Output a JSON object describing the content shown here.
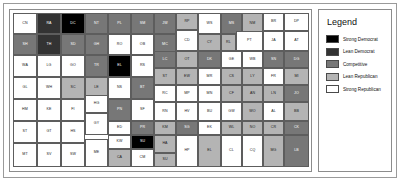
{
  "figure": {
    "kind": "choropleth-map"
  },
  "legend": {
    "title": "Legend",
    "items": [
      {
        "label": "Strong Democrat",
        "color": "#000000",
        "class": "c0"
      },
      {
        "label": "Lean Democrat",
        "color": "#333333",
        "class": "c1"
      },
      {
        "label": "Competitive",
        "color": "#777777",
        "class": "c2"
      },
      {
        "label": "Lean Republican",
        "color": "#b4b4b4",
        "class": "c3"
      },
      {
        "label": "Strong Republican",
        "color": "#ffffff",
        "class": "c4"
      }
    ]
  },
  "chart_data": {
    "type": "heatmap",
    "title": "",
    "xlabel": "",
    "ylabel": "",
    "grid": false,
    "legend_position": "right",
    "value_scale": [
      "Strong Democrat",
      "Lean Democrat",
      "Competitive",
      "Lean Republican",
      "Strong Republican"
    ],
    "counties": [
      {
        "code": "CN",
        "x": 3,
        "y": 3,
        "w": 24,
        "h": 21,
        "level": 4
      },
      {
        "code": "RA",
        "x": 27,
        "y": 3,
        "w": 24,
        "h": 21,
        "level": 1
      },
      {
        "code": "DC",
        "x": 51,
        "y": 3,
        "w": 24,
        "h": 21,
        "level": 0
      },
      {
        "code": "NT",
        "x": 75,
        "y": 3,
        "w": 23,
        "h": 21,
        "level": 2
      },
      {
        "code": "PL",
        "x": 98,
        "y": 3,
        "w": 23,
        "h": 21,
        "level": 2
      },
      {
        "code": "SM",
        "x": 121,
        "y": 3,
        "w": 23,
        "h": 21,
        "level": 2
      },
      {
        "code": "JW",
        "x": 144,
        "y": 3,
        "w": 22,
        "h": 21,
        "level": 2
      },
      {
        "code": "RP",
        "x": 166,
        "y": 3,
        "w": 22,
        "h": 17,
        "level": 3
      },
      {
        "code": "WS",
        "x": 188,
        "y": 3,
        "w": 23,
        "h": 21,
        "level": 4
      },
      {
        "code": "MS",
        "x": 211,
        "y": 3,
        "w": 21,
        "h": 21,
        "level": 2
      },
      {
        "code": "NM",
        "x": 232,
        "y": 3,
        "w": 21,
        "h": 21,
        "level": 3
      },
      {
        "code": "BR",
        "x": 253,
        "y": 3,
        "w": 21,
        "h": 18,
        "level": 4
      },
      {
        "code": "DP",
        "x": 274,
        "y": 3,
        "w": 25,
        "h": 18,
        "level": 4
      },
      {
        "code": "SH",
        "x": 3,
        "y": 24,
        "w": 24,
        "h": 21,
        "level": 2
      },
      {
        "code": "TH",
        "x": 27,
        "y": 24,
        "w": 24,
        "h": 21,
        "level": 1
      },
      {
        "code": "SD",
        "x": 51,
        "y": 24,
        "w": 24,
        "h": 21,
        "level": 2
      },
      {
        "code": "GH",
        "x": 75,
        "y": 24,
        "w": 23,
        "h": 21,
        "level": 2
      },
      {
        "code": "RO",
        "x": 98,
        "y": 24,
        "w": 23,
        "h": 21,
        "level": 4
      },
      {
        "code": "OB",
        "x": 121,
        "y": 24,
        "w": 23,
        "h": 21,
        "level": 4
      },
      {
        "code": "MC",
        "x": 144,
        "y": 24,
        "w": 22,
        "h": 21,
        "level": 2
      },
      {
        "code": "CD",
        "x": 166,
        "y": 20,
        "w": 22,
        "h": 21,
        "level": 4
      },
      {
        "code": "CY",
        "x": 188,
        "y": 24,
        "w": 23,
        "h": 17,
        "level": 3
      },
      {
        "code": "RL",
        "x": 211,
        "y": 24,
        "w": 15,
        "h": 17,
        "level": 3
      },
      {
        "code": "PT",
        "x": 226,
        "y": 21,
        "w": 27,
        "h": 20,
        "level": 4
      },
      {
        "code": "JA",
        "x": 253,
        "y": 21,
        "w": 21,
        "h": 20,
        "level": 4
      },
      {
        "code": "AT",
        "x": 274,
        "y": 21,
        "w": 25,
        "h": 20,
        "level": 4
      },
      {
        "code": "WA",
        "x": 3,
        "y": 45,
        "w": 24,
        "h": 22,
        "level": 4
      },
      {
        "code": "LG",
        "x": 27,
        "y": 45,
        "w": 24,
        "h": 22,
        "level": 4
      },
      {
        "code": "GO",
        "x": 51,
        "y": 45,
        "w": 24,
        "h": 22,
        "level": 4
      },
      {
        "code": "TR",
        "x": 75,
        "y": 45,
        "w": 23,
        "h": 22,
        "level": 2
      },
      {
        "code": "EL",
        "x": 98,
        "y": 45,
        "w": 23,
        "h": 22,
        "level": 0
      },
      {
        "code": "RS",
        "x": 121,
        "y": 45,
        "w": 23,
        "h": 22,
        "level": 4
      },
      {
        "code": "LC",
        "x": 144,
        "y": 41,
        "w": 22,
        "h": 17,
        "level": 2
      },
      {
        "code": "OT",
        "x": 166,
        "y": 41,
        "w": 22,
        "h": 17,
        "level": 3
      },
      {
        "code": "DK",
        "x": 188,
        "y": 41,
        "w": 23,
        "h": 17,
        "level": 2
      },
      {
        "code": "GE",
        "x": 211,
        "y": 41,
        "w": 21,
        "h": 17,
        "level": 4
      },
      {
        "code": "WB",
        "x": 232,
        "y": 41,
        "w": 21,
        "h": 17,
        "level": 4
      },
      {
        "code": "SN",
        "x": 253,
        "y": 41,
        "w": 21,
        "h": 17,
        "level": 2
      },
      {
        "code": "DG",
        "x": 274,
        "y": 41,
        "w": 25,
        "h": 17,
        "level": 2
      },
      {
        "code": "GL",
        "x": 3,
        "y": 67,
        "w": 24,
        "h": 22,
        "level": 4
      },
      {
        "code": "WH",
        "x": 27,
        "y": 67,
        "w": 24,
        "h": 22,
        "level": 4
      },
      {
        "code": "SC",
        "x": 51,
        "y": 67,
        "w": 24,
        "h": 22,
        "level": 3
      },
      {
        "code": "LE",
        "x": 75,
        "y": 67,
        "w": 23,
        "h": 22,
        "level": 3
      },
      {
        "code": "NS",
        "x": 98,
        "y": 67,
        "w": 23,
        "h": 22,
        "level": 4
      },
      {
        "code": "BT",
        "x": 121,
        "y": 67,
        "w": 23,
        "h": 22,
        "level": 2
      },
      {
        "code": "ST",
        "x": 144,
        "y": 58,
        "w": 22,
        "h": 17,
        "level": 3
      },
      {
        "code": "EW",
        "x": 166,
        "y": 58,
        "w": 22,
        "h": 17,
        "level": 3
      },
      {
        "code": "MR",
        "x": 188,
        "y": 58,
        "w": 23,
        "h": 17,
        "level": 4
      },
      {
        "code": "CS",
        "x": 211,
        "y": 58,
        "w": 21,
        "h": 17,
        "level": 3
      },
      {
        "code": "LY",
        "x": 232,
        "y": 58,
        "w": 21,
        "h": 17,
        "level": 3
      },
      {
        "code": "FR",
        "x": 253,
        "y": 58,
        "w": 21,
        "h": 17,
        "level": 4
      },
      {
        "code": "MI",
        "x": 274,
        "y": 58,
        "w": 25,
        "h": 17,
        "level": 3
      },
      {
        "code": "HM",
        "x": 3,
        "y": 89,
        "w": 24,
        "h": 22,
        "level": 4
      },
      {
        "code": "KE",
        "x": 27,
        "y": 89,
        "w": 24,
        "h": 22,
        "level": 4
      },
      {
        "code": "FI",
        "x": 51,
        "y": 89,
        "w": 24,
        "h": 22,
        "level": 4
      },
      {
        "code": "HG",
        "x": 75,
        "y": 85,
        "w": 23,
        "h": 18,
        "level": 4
      },
      {
        "code": "PN",
        "x": 98,
        "y": 89,
        "w": 23,
        "h": 22,
        "level": 2
      },
      {
        "code": "SF",
        "x": 121,
        "y": 89,
        "w": 23,
        "h": 22,
        "level": 4
      },
      {
        "code": "RC",
        "x": 144,
        "y": 75,
        "w": 22,
        "h": 17,
        "level": 4
      },
      {
        "code": "MP",
        "x": 166,
        "y": 75,
        "w": 22,
        "h": 17,
        "level": 4
      },
      {
        "code": "MN",
        "x": 188,
        "y": 75,
        "w": 23,
        "h": 17,
        "level": 4
      },
      {
        "code": "CF",
        "x": 211,
        "y": 75,
        "w": 21,
        "h": 17,
        "level": 3
      },
      {
        "code": "AN",
        "x": 232,
        "y": 75,
        "w": 21,
        "h": 17,
        "level": 3
      },
      {
        "code": "LN",
        "x": 253,
        "y": 75,
        "w": 21,
        "h": 17,
        "level": 3
      },
      {
        "code": "JO",
        "x": 274,
        "y": 75,
        "w": 25,
        "h": 17,
        "level": 2
      },
      {
        "code": "GY",
        "x": 75,
        "y": 103,
        "w": 23,
        "h": 22,
        "level": 4
      },
      {
        "code": "HS",
        "x": 51,
        "y": 111,
        "w": 24,
        "h": 22,
        "level": 4
      },
      {
        "code": "GT",
        "x": 27,
        "y": 111,
        "w": 24,
        "h": 22,
        "level": 4
      },
      {
        "code": "ST",
        "x": 3,
        "y": 111,
        "w": 24,
        "h": 22,
        "level": 4
      },
      {
        "code": "ED",
        "x": 98,
        "y": 111,
        "w": 23,
        "h": 14,
        "level": 4
      },
      {
        "code": "KW",
        "x": 98,
        "y": 125,
        "w": 23,
        "h": 14,
        "level": 4
      },
      {
        "code": "RN",
        "x": 144,
        "y": 92,
        "w": 22,
        "h": 19,
        "level": 4
      },
      {
        "code": "HV",
        "x": 166,
        "y": 92,
        "w": 22,
        "h": 19,
        "level": 4
      },
      {
        "code": "BU",
        "x": 188,
        "y": 92,
        "w": 23,
        "h": 19,
        "level": 4
      },
      {
        "code": "GW",
        "x": 211,
        "y": 92,
        "w": 21,
        "h": 19,
        "level": 4
      },
      {
        "code": "WO",
        "x": 232,
        "y": 92,
        "w": 21,
        "h": 19,
        "level": 3
      },
      {
        "code": "AL",
        "x": 253,
        "y": 92,
        "w": 21,
        "h": 19,
        "level": 4
      },
      {
        "code": "BB",
        "x": 274,
        "y": 92,
        "w": 25,
        "h": 19,
        "level": 3
      },
      {
        "code": "PR",
        "x": 121,
        "y": 111,
        "w": 23,
        "h": 14,
        "level": 2
      },
      {
        "code": "SU",
        "x": 121,
        "y": 125,
        "w": 23,
        "h": 14,
        "level": 0
      },
      {
        "code": "KM",
        "x": 144,
        "y": 111,
        "w": 22,
        "h": 14,
        "level": 3
      },
      {
        "code": "SG",
        "x": 166,
        "y": 111,
        "w": 22,
        "h": 14,
        "level": 2
      },
      {
        "code": "EK",
        "x": 188,
        "y": 111,
        "w": 23,
        "h": 14,
        "level": 4
      },
      {
        "code": "WL",
        "x": 211,
        "y": 111,
        "w": 21,
        "h": 14,
        "level": 3
      },
      {
        "code": "NO",
        "x": 232,
        "y": 111,
        "w": 21,
        "h": 14,
        "level": 3
      },
      {
        "code": "CR",
        "x": 253,
        "y": 111,
        "w": 21,
        "h": 14,
        "level": 3
      },
      {
        "code": "CK",
        "x": 274,
        "y": 111,
        "w": 25,
        "h": 14,
        "level": 2
      },
      {
        "code": "MT",
        "x": 3,
        "y": 133,
        "w": 24,
        "h": 24,
        "level": 4
      },
      {
        "code": "SV",
        "x": 27,
        "y": 133,
        "w": 24,
        "h": 24,
        "level": 4
      },
      {
        "code": "SW",
        "x": 51,
        "y": 133,
        "w": 24,
        "h": 24,
        "level": 4
      },
      {
        "code": "ME",
        "x": 75,
        "y": 129,
        "w": 23,
        "h": 28,
        "level": 4
      },
      {
        "code": "CA",
        "x": 98,
        "y": 139,
        "w": 23,
        "h": 18,
        "level": 3
      },
      {
        "code": "CM",
        "x": 121,
        "y": 139,
        "w": 23,
        "h": 18,
        "level": 4
      },
      {
        "code": "HA",
        "x": 144,
        "y": 125,
        "w": 22,
        "h": 18,
        "level": 3
      },
      {
        "code": "HP",
        "x": 166,
        "y": 125,
        "w": 22,
        "h": 32,
        "level": 4
      },
      {
        "code": "SU2",
        "x": 144,
        "y": 143,
        "w": 22,
        "h": 14,
        "level": 3
      },
      {
        "code": "EL2",
        "x": 188,
        "y": 125,
        "w": 23,
        "h": 32,
        "level": 3
      },
      {
        "code": "CL",
        "x": 211,
        "y": 125,
        "w": 21,
        "h": 32,
        "level": 4
      },
      {
        "code": "CQ",
        "x": 232,
        "y": 125,
        "w": 21,
        "h": 32,
        "level": 4
      },
      {
        "code": "MG",
        "x": 253,
        "y": 125,
        "w": 21,
        "h": 32,
        "level": 3
      },
      {
        "code": "LB",
        "x": 274,
        "y": 125,
        "w": 25,
        "h": 32,
        "level": 2
      }
    ]
  }
}
